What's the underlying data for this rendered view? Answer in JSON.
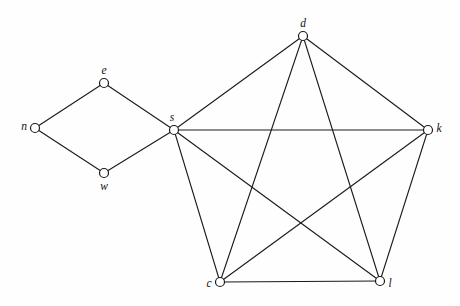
{
  "figure": {
    "background_color": "#fefefe",
    "stroke_color": "#1a1a1a",
    "node_fill_color": "#ffffff",
    "width": 460,
    "height": 306
  },
  "chart_data": {
    "type": "diagram",
    "graph_type": "undirected-graph",
    "title": "",
    "xlabel": "",
    "ylabel": "",
    "grid": false,
    "legend": "none",
    "node_count": 8,
    "edge_count": 14,
    "nodes": [
      {
        "id": "n",
        "label": "n",
        "x": 35,
        "y": 128,
        "r": 4.5,
        "label_dx": -11,
        "label_dy": -1,
        "label_anchor": "middle"
      },
      {
        "id": "e",
        "label": "e",
        "x": 104,
        "y": 83,
        "r": 4.5,
        "label_dx": 0,
        "label_dy": -12,
        "label_anchor": "middle"
      },
      {
        "id": "w",
        "label": "w",
        "x": 104,
        "y": 173,
        "r": 4.5,
        "label_dx": 0,
        "label_dy": 14,
        "label_anchor": "middle"
      },
      {
        "id": "s",
        "label": "s",
        "x": 174,
        "y": 130,
        "r": 4.5,
        "label_dx": -2,
        "label_dy": -12,
        "label_anchor": "middle"
      },
      {
        "id": "d",
        "label": "d",
        "x": 303,
        "y": 36,
        "r": 4.5,
        "label_dx": 0,
        "label_dy": -12,
        "label_anchor": "middle"
      },
      {
        "id": "k",
        "label": "k",
        "x": 428,
        "y": 130,
        "r": 4.5,
        "label_dx": 11,
        "label_dy": -1,
        "label_anchor": "middle"
      },
      {
        "id": "c",
        "label": "c",
        "x": 220,
        "y": 282,
        "r": 4.5,
        "label_dx": -11,
        "label_dy": 2,
        "label_anchor": "middle"
      },
      {
        "id": "l",
        "label": "l",
        "x": 380,
        "y": 281,
        "r": 4.5,
        "label_dx": 10,
        "label_dy": 3,
        "label_anchor": "middle"
      }
    ],
    "edges": [
      {
        "from": "n",
        "to": "e"
      },
      {
        "from": "n",
        "to": "w"
      },
      {
        "from": "e",
        "to": "s"
      },
      {
        "from": "w",
        "to": "s"
      },
      {
        "from": "s",
        "to": "d"
      },
      {
        "from": "s",
        "to": "k"
      },
      {
        "from": "s",
        "to": "c"
      },
      {
        "from": "s",
        "to": "l"
      },
      {
        "from": "d",
        "to": "k"
      },
      {
        "from": "d",
        "to": "c"
      },
      {
        "from": "d",
        "to": "l"
      },
      {
        "from": "k",
        "to": "c"
      },
      {
        "from": "k",
        "to": "l"
      },
      {
        "from": "c",
        "to": "l"
      }
    ],
    "components": [
      {
        "name": "left-diamond",
        "nodes": [
          "n",
          "e",
          "w",
          "s"
        ]
      },
      {
        "name": "right-complete-k5",
        "nodes": [
          "s",
          "d",
          "k",
          "c",
          "l"
        ]
      }
    ]
  }
}
